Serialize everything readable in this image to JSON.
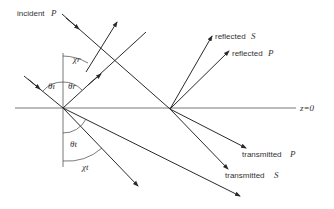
{
  "diagram": {
    "type": "reflection-refraction-geometry",
    "labels": {
      "incident": "incident",
      "incident_pol": "P",
      "reflected_s": "reflected",
      "reflected_s_pol": "S",
      "reflected_p": "reflected",
      "reflected_p_pol": "P",
      "transmitted_p": "transmitted",
      "transmitted_p_pol": "P",
      "transmitted_s": "transmitted",
      "transmitted_s_pol": "S",
      "interface": "z=0",
      "theta_i": "θi",
      "theta_r": "θr",
      "theta_t": "θt",
      "chi_r": "χr",
      "chi_t": "χt"
    },
    "colors": {
      "stroke": "#2a2a2a",
      "background": "#ffffff"
    }
  }
}
